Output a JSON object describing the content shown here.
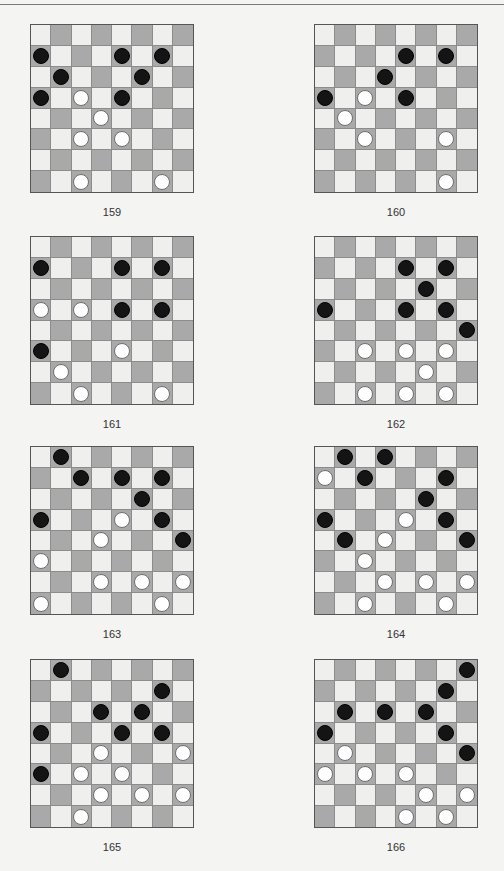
{
  "page": {
    "colors": {
      "background": "#f4f4f2",
      "light_square": "#efefee",
      "dark_square": "#a9a9a9",
      "black_piece": "#141414",
      "white_piece": "#ffffff"
    }
  },
  "diagrams": [
    {
      "label": "159",
      "pieces": [
        {
          "row": 1,
          "col": 0,
          "color": "black"
        },
        {
          "row": 1,
          "col": 4,
          "color": "black"
        },
        {
          "row": 1,
          "col": 6,
          "color": "black"
        },
        {
          "row": 2,
          "col": 1,
          "color": "black"
        },
        {
          "row": 2,
          "col": 5,
          "color": "black"
        },
        {
          "row": 3,
          "col": 0,
          "color": "black"
        },
        {
          "row": 3,
          "col": 2,
          "color": "white"
        },
        {
          "row": 3,
          "col": 4,
          "color": "black"
        },
        {
          "row": 4,
          "col": 3,
          "color": "white"
        },
        {
          "row": 5,
          "col": 2,
          "color": "white"
        },
        {
          "row": 5,
          "col": 4,
          "color": "white"
        },
        {
          "row": 7,
          "col": 2,
          "color": "white"
        },
        {
          "row": 7,
          "col": 6,
          "color": "white"
        }
      ]
    },
    {
      "label": "160",
      "pieces": [
        {
          "row": 1,
          "col": 4,
          "color": "black"
        },
        {
          "row": 1,
          "col": 6,
          "color": "black"
        },
        {
          "row": 2,
          "col": 3,
          "color": "black"
        },
        {
          "row": 3,
          "col": 0,
          "color": "black"
        },
        {
          "row": 3,
          "col": 2,
          "color": "white"
        },
        {
          "row": 3,
          "col": 4,
          "color": "black"
        },
        {
          "row": 4,
          "col": 1,
          "color": "white"
        },
        {
          "row": 5,
          "col": 2,
          "color": "white"
        },
        {
          "row": 5,
          "col": 6,
          "color": "white"
        },
        {
          "row": 7,
          "col": 6,
          "color": "white"
        }
      ]
    },
    {
      "label": "161",
      "pieces": [
        {
          "row": 1,
          "col": 0,
          "color": "black"
        },
        {
          "row": 1,
          "col": 4,
          "color": "black"
        },
        {
          "row": 1,
          "col": 6,
          "color": "black"
        },
        {
          "row": 3,
          "col": 0,
          "color": "white"
        },
        {
          "row": 3,
          "col": 2,
          "color": "white"
        },
        {
          "row": 3,
          "col": 4,
          "color": "black"
        },
        {
          "row": 3,
          "col": 6,
          "color": "black"
        },
        {
          "row": 5,
          "col": 0,
          "color": "black"
        },
        {
          "row": 5,
          "col": 4,
          "color": "white"
        },
        {
          "row": 6,
          "col": 1,
          "color": "white"
        },
        {
          "row": 7,
          "col": 2,
          "color": "white"
        },
        {
          "row": 7,
          "col": 6,
          "color": "white"
        }
      ]
    },
    {
      "label": "162",
      "pieces": [
        {
          "row": 1,
          "col": 4,
          "color": "black"
        },
        {
          "row": 1,
          "col": 6,
          "color": "black"
        },
        {
          "row": 2,
          "col": 5,
          "color": "black"
        },
        {
          "row": 3,
          "col": 0,
          "color": "black"
        },
        {
          "row": 3,
          "col": 4,
          "color": "black"
        },
        {
          "row": 3,
          "col": 6,
          "color": "black"
        },
        {
          "row": 4,
          "col": 7,
          "color": "black"
        },
        {
          "row": 5,
          "col": 2,
          "color": "white"
        },
        {
          "row": 5,
          "col": 4,
          "color": "white"
        },
        {
          "row": 5,
          "col": 6,
          "color": "white"
        },
        {
          "row": 6,
          "col": 5,
          "color": "white"
        },
        {
          "row": 7,
          "col": 2,
          "color": "white"
        },
        {
          "row": 7,
          "col": 4,
          "color": "white"
        },
        {
          "row": 7,
          "col": 6,
          "color": "white"
        }
      ]
    },
    {
      "label": "163",
      "pieces": [
        {
          "row": 0,
          "col": 1,
          "color": "black"
        },
        {
          "row": 1,
          "col": 2,
          "color": "black"
        },
        {
          "row": 1,
          "col": 4,
          "color": "black"
        },
        {
          "row": 1,
          "col": 6,
          "color": "black"
        },
        {
          "row": 2,
          "col": 5,
          "color": "black"
        },
        {
          "row": 3,
          "col": 0,
          "color": "black"
        },
        {
          "row": 3,
          "col": 4,
          "color": "white"
        },
        {
          "row": 3,
          "col": 6,
          "color": "black"
        },
        {
          "row": 4,
          "col": 3,
          "color": "white"
        },
        {
          "row": 4,
          "col": 7,
          "color": "black"
        },
        {
          "row": 5,
          "col": 0,
          "color": "white"
        },
        {
          "row": 6,
          "col": 3,
          "color": "white"
        },
        {
          "row": 6,
          "col": 5,
          "color": "white"
        },
        {
          "row": 6,
          "col": 7,
          "color": "white"
        },
        {
          "row": 7,
          "col": 0,
          "color": "white"
        },
        {
          "row": 7,
          "col": 6,
          "color": "white"
        }
      ]
    },
    {
      "label": "164",
      "pieces": [
        {
          "row": 0,
          "col": 1,
          "color": "black"
        },
        {
          "row": 0,
          "col": 3,
          "color": "black"
        },
        {
          "row": 1,
          "col": 0,
          "color": "white"
        },
        {
          "row": 1,
          "col": 2,
          "color": "black"
        },
        {
          "row": 1,
          "col": 6,
          "color": "black"
        },
        {
          "row": 2,
          "col": 5,
          "color": "black"
        },
        {
          "row": 3,
          "col": 0,
          "color": "black"
        },
        {
          "row": 3,
          "col": 4,
          "color": "white"
        },
        {
          "row": 3,
          "col": 6,
          "color": "black"
        },
        {
          "row": 4,
          "col": 1,
          "color": "black"
        },
        {
          "row": 4,
          "col": 3,
          "color": "white"
        },
        {
          "row": 4,
          "col": 7,
          "color": "black"
        },
        {
          "row": 5,
          "col": 2,
          "color": "white"
        },
        {
          "row": 6,
          "col": 3,
          "color": "white"
        },
        {
          "row": 6,
          "col": 5,
          "color": "white"
        },
        {
          "row": 6,
          "col": 7,
          "color": "white"
        },
        {
          "row": 7,
          "col": 2,
          "color": "white"
        },
        {
          "row": 7,
          "col": 6,
          "color": "white"
        }
      ]
    },
    {
      "label": "165",
      "pieces": [
        {
          "row": 0,
          "col": 1,
          "color": "black"
        },
        {
          "row": 1,
          "col": 6,
          "color": "black"
        },
        {
          "row": 2,
          "col": 3,
          "color": "black"
        },
        {
          "row": 2,
          "col": 5,
          "color": "black"
        },
        {
          "row": 3,
          "col": 0,
          "color": "black"
        },
        {
          "row": 3,
          "col": 4,
          "color": "black"
        },
        {
          "row": 3,
          "col": 6,
          "color": "black"
        },
        {
          "row": 4,
          "col": 3,
          "color": "white"
        },
        {
          "row": 4,
          "col": 7,
          "color": "white"
        },
        {
          "row": 5,
          "col": 0,
          "color": "black"
        },
        {
          "row": 5,
          "col": 2,
          "color": "white"
        },
        {
          "row": 5,
          "col": 4,
          "color": "white"
        },
        {
          "row": 6,
          "col": 3,
          "color": "white"
        },
        {
          "row": 6,
          "col": 5,
          "color": "white"
        },
        {
          "row": 6,
          "col": 7,
          "color": "white"
        },
        {
          "row": 7,
          "col": 2,
          "color": "white"
        }
      ]
    },
    {
      "label": "166",
      "pieces": [
        {
          "row": 0,
          "col": 7,
          "color": "black"
        },
        {
          "row": 1,
          "col": 6,
          "color": "black"
        },
        {
          "row": 2,
          "col": 1,
          "color": "black"
        },
        {
          "row": 2,
          "col": 3,
          "color": "black"
        },
        {
          "row": 2,
          "col": 5,
          "color": "black"
        },
        {
          "row": 3,
          "col": 0,
          "color": "black"
        },
        {
          "row": 3,
          "col": 6,
          "color": "black"
        },
        {
          "row": 4,
          "col": 1,
          "color": "white"
        },
        {
          "row": 4,
          "col": 7,
          "color": "black"
        },
        {
          "row": 5,
          "col": 0,
          "color": "white"
        },
        {
          "row": 5,
          "col": 2,
          "color": "white"
        },
        {
          "row": 5,
          "col": 4,
          "color": "white"
        },
        {
          "row": 6,
          "col": 5,
          "color": "white"
        },
        {
          "row": 6,
          "col": 7,
          "color": "white"
        },
        {
          "row": 7,
          "col": 4,
          "color": "white"
        },
        {
          "row": 7,
          "col": 6,
          "color": "white"
        }
      ]
    }
  ]
}
